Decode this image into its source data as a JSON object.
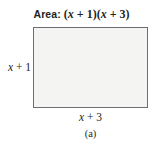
{
  "figure": {
    "title": {
      "lead": "Area:",
      "expression": "(x + 1)(x + 3)",
      "expr_parts": {
        "open1": "(",
        "var1": "x",
        "op1": " + ",
        "num1": "1",
        "close1": ")",
        "open2": "(",
        "var2": "x",
        "op2": " + ",
        "num2": "3",
        "close2": ")"
      }
    },
    "rectangle": {
      "height_label": {
        "var": "x",
        "op": " + ",
        "num": "1",
        "text": "x + 1"
      },
      "width_label": {
        "var": "x",
        "op": " + ",
        "num": "3",
        "text": "x + 3"
      },
      "fill_color": "#f4f4f2",
      "border_color": "#6d6e71"
    },
    "caption": "(a)",
    "background_color": "#ffffff",
    "text_color": "#231f20"
  }
}
